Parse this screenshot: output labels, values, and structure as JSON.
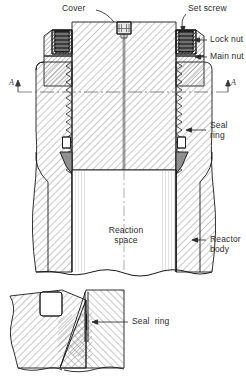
{
  "figure": {
    "kind": "engineering-cross-section",
    "section_marks": {
      "left": "A",
      "right": "A"
    }
  },
  "labels": {
    "cover": "Cover",
    "set_screw": "Set screw",
    "lock_nut": "Lock nut",
    "main_nut": "Main nut",
    "seal_ring_upper_line1": "Seal",
    "seal_ring_upper_line2": "ring",
    "reaction_space_line1": "Reaction",
    "reaction_space_line2": "space",
    "reactor_body_line1": "Reactor",
    "reactor_body_line2": "body",
    "seal_ring_detail": "Seal  ring"
  },
  "colors": {
    "line": "#1a1a1a",
    "hatch": "#7d7d7d",
    "hatch_dark": "#2e2e2e",
    "seal_fill": "#8f8f8f",
    "center_line": "#6b6b6b",
    "background": "#ffffff",
    "text": "#2b2b2b"
  },
  "geometry": {
    "center_x": 124,
    "axis_y": 92,
    "cover_top_y": 18,
    "bore_bottom_y": 272
  }
}
